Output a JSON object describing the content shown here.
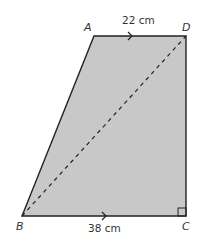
{
  "figure": {
    "type": "trapezium",
    "fill_color": "#c8c8c8",
    "stroke_color": "#222222",
    "vertices": [
      {
        "label": "A",
        "x": 94,
        "y": 36
      },
      {
        "label": "D",
        "x": 186,
        "y": 36
      },
      {
        "label": "C",
        "x": 186,
        "y": 216
      },
      {
        "label": "B",
        "x": 22,
        "y": 216
      }
    ],
    "labels": {
      "A": "A",
      "D": "D",
      "B": "B",
      "C": "C"
    },
    "measurements": {
      "top": "22 cm",
      "bottom": "38 cm"
    },
    "diagonal": {
      "from": "B",
      "to": "D",
      "style": "dashed"
    },
    "right_angle_at": "C",
    "parallel_marks": [
      "AD",
      "BC"
    ]
  }
}
